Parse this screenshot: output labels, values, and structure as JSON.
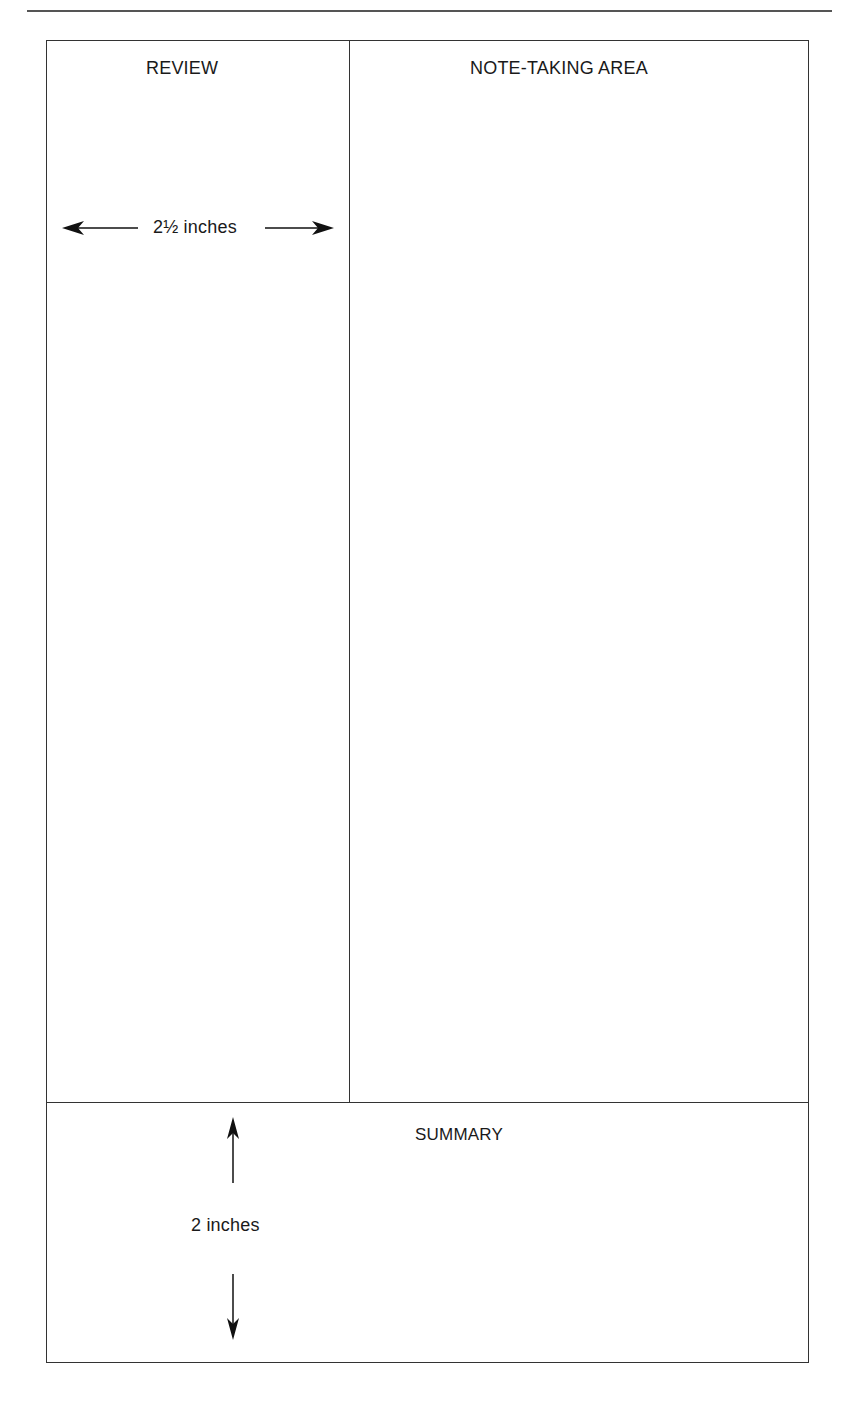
{
  "page": {
    "type": "Cornell note-taking template",
    "sections": {
      "review": {
        "label": "REVIEW"
      },
      "notes": {
        "label": "NOTE-TAKING AREA"
      },
      "summary": {
        "label": "SUMMARY"
      }
    },
    "dimensions": {
      "review_width": "2½ inches",
      "summary_height": "2 inches"
    },
    "colors": {
      "line": "#333333",
      "text": "#1a1a1a",
      "background": "#ffffff"
    }
  }
}
